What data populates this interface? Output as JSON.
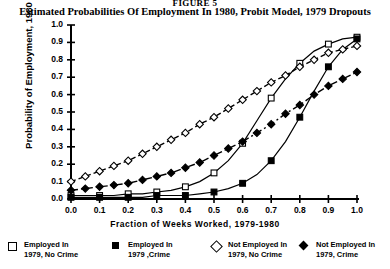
{
  "figure_number": "FIGURE 5",
  "title": "Estimated Probabilities Of Employment In 1980, Probit Model, 1979 Dropouts",
  "axis": {
    "y_label": "Probability of Employment, 1980",
    "x_label": "Fraction of Weeks Worked, 1979-1980",
    "x_ticks": [
      "0.0",
      "0.1",
      "0.2",
      "0.3",
      "0.4",
      "0.5",
      "0.6",
      "0.7",
      "0.8",
      "0.9",
      "1.0"
    ],
    "y_ticks": [
      "0.0",
      "0.1",
      "0.2",
      "0.3",
      "0.4",
      "0.5",
      "0.6",
      "0.7",
      "0.8",
      "0.9",
      "1.0"
    ]
  },
  "legend": {
    "items": [
      {
        "marker": "open-square",
        "line1": "Employed In",
        "line2": "1979, No Crime"
      },
      {
        "marker": "filled-square",
        "line1": "Employed In",
        "line2": "1979 ,Crime"
      },
      {
        "marker": "open-diamond",
        "line1": "Not Employed In",
        "line2": "1979, No Crime"
      },
      {
        "marker": "filled-diamond",
        "line1": "Not Employed In",
        "line2": "1979, Crime"
      }
    ]
  },
  "chart_data": {
    "type": "line",
    "title": "Estimated Probabilities Of Employment In 1980, Probit Model, 1979 Dropouts",
    "xlabel": "Fraction of Weeks Worked, 1979-1980",
    "ylabel": "Probability of Employment, 1980",
    "xlim": [
      0.0,
      1.0
    ],
    "ylim": [
      0.0,
      1.0
    ],
    "grid": false,
    "legend_position": "below",
    "x": [
      0.0,
      0.05,
      0.1,
      0.15,
      0.2,
      0.25,
      0.3,
      0.35,
      0.4,
      0.45,
      0.5,
      0.55,
      0.6,
      0.65,
      0.7,
      0.75,
      0.8,
      0.85,
      0.9,
      0.95,
      1.0
    ],
    "series": [
      {
        "name": "Employed In 1979, No Crime",
        "marker": "open-square",
        "linestyle": "solid",
        "values": [
          0.02,
          0.02,
          0.02,
          0.02,
          0.03,
          0.03,
          0.04,
          0.05,
          0.07,
          0.1,
          0.15,
          0.22,
          0.32,
          0.45,
          0.58,
          0.69,
          0.78,
          0.85,
          0.89,
          0.92,
          0.93
        ]
      },
      {
        "name": "Employed In 1979, Crime",
        "marker": "filled-square",
        "linestyle": "solid",
        "values": [
          0.01,
          0.01,
          0.01,
          0.01,
          0.01,
          0.01,
          0.02,
          0.02,
          0.02,
          0.03,
          0.04,
          0.06,
          0.09,
          0.14,
          0.22,
          0.33,
          0.47,
          0.62,
          0.76,
          0.86,
          0.92
        ]
      },
      {
        "name": "Not Employed In 1979, No Crime",
        "marker": "open-diamond",
        "linestyle": "dashed",
        "values": [
          0.1,
          0.13,
          0.16,
          0.19,
          0.22,
          0.26,
          0.3,
          0.34,
          0.38,
          0.43,
          0.47,
          0.52,
          0.57,
          0.62,
          0.67,
          0.71,
          0.76,
          0.8,
          0.84,
          0.86,
          0.88
        ]
      },
      {
        "name": "Not Employed In 1979, Crime",
        "marker": "filled-diamond",
        "linestyle": "dashdot",
        "values": [
          0.05,
          0.06,
          0.07,
          0.08,
          0.09,
          0.11,
          0.13,
          0.15,
          0.18,
          0.21,
          0.25,
          0.29,
          0.33,
          0.38,
          0.43,
          0.49,
          0.54,
          0.6,
          0.65,
          0.69,
          0.73
        ]
      }
    ]
  }
}
